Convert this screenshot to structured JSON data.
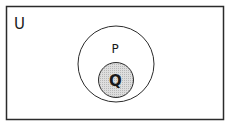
{
  "diagram": {
    "type": "venn",
    "universal_set": {
      "label": "U",
      "stroke": "#2b2b2b",
      "fill": "#ffffff"
    },
    "sets": [
      {
        "label": "P",
        "stroke": "#2b2b2b",
        "fill": "#ffffff"
      },
      {
        "label": "Q",
        "stroke": "#2b2b2b",
        "fill": "#d4d4d4",
        "shaded": true,
        "subset_of": "P"
      }
    ],
    "relationship": "Q is a subset of P"
  }
}
